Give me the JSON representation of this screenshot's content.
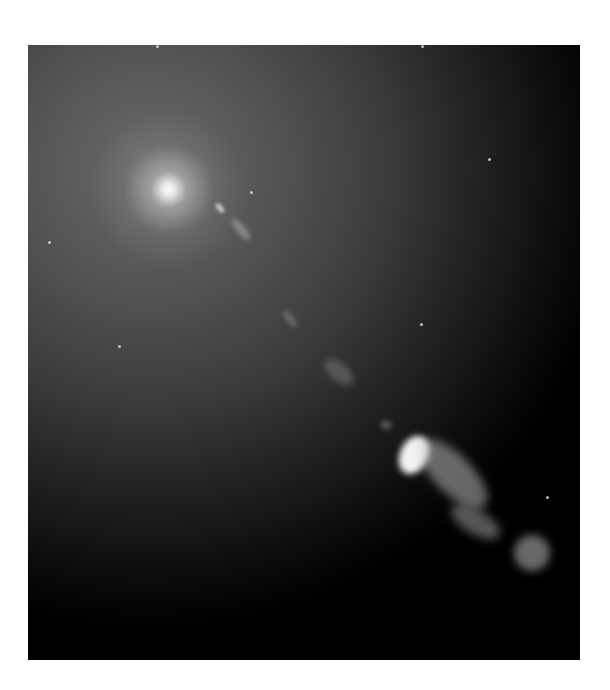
{
  "image": {
    "subject": "galaxy core with relativistic jet",
    "colors": {
      "background": "#ffffff",
      "sky_bright": "#6a6a6a",
      "sky_dark": "#000000",
      "core": "#ffffff"
    }
  }
}
